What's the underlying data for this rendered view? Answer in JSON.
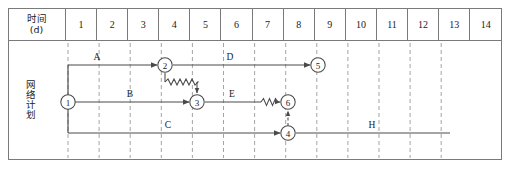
{
  "diagram": {
    "title": "网络计划",
    "side_label": "网络计划",
    "header": {
      "time_label_line1": "时间",
      "time_label_line2": "(d)",
      "days": [
        "1",
        "2",
        "3",
        "4",
        "5",
        "6",
        "7",
        "8",
        "9",
        "10",
        "11",
        "12",
        "13",
        "14"
      ]
    },
    "nodes": [
      {
        "id": "1",
        "label": "1",
        "x": 68,
        "y": 102
      },
      {
        "id": "2",
        "label": "2",
        "x": 165,
        "y": 65
      },
      {
        "id": "3",
        "label": "3",
        "x": 197,
        "y": 102
      },
      {
        "id": "4",
        "label": "4",
        "x": 288,
        "y": 133
      },
      {
        "id": "5",
        "label": "5",
        "x": 318,
        "y": 65
      },
      {
        "id": "6",
        "label": "6",
        "x": 288,
        "y": 102
      }
    ],
    "activities": [
      {
        "name": "A",
        "from": "1",
        "to": "2",
        "label": "A",
        "label_x": 97,
        "label_y": 60
      },
      {
        "name": "D",
        "from": "2",
        "to": "5",
        "label": "D",
        "label_x": 230,
        "label_y": 60
      },
      {
        "name": "B",
        "from": "1",
        "to": "3",
        "label": "B",
        "label_x": 130,
        "label_y": 97
      },
      {
        "name": "E",
        "from": "3",
        "to": "6",
        "label": "E",
        "label_x": 232,
        "label_y": 97
      },
      {
        "name": "C",
        "from": "1",
        "to": "4",
        "label": "C",
        "label_x": 168,
        "label_y": 128
      },
      {
        "name": "H",
        "from": "4",
        "to": "end",
        "label": "H",
        "label_x": 372,
        "label_y": 128
      }
    ],
    "links": [
      {
        "type": "wavy",
        "from": "2",
        "to": "3",
        "note": "lag-link-2-3"
      },
      {
        "type": "dashed",
        "from": "4",
        "to": "6",
        "note": "dummy-link-4-6"
      }
    ],
    "colors": {
      "line": "#4a4a4a",
      "border": "#7a7a7a",
      "text": "#1a1a1a",
      "grid_dash": "#9a9a9a"
    }
  }
}
